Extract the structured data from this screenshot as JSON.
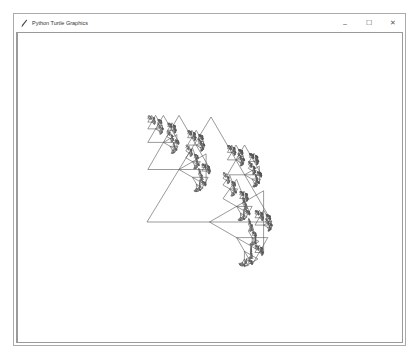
{
  "window": {
    "title": "Python Turtle Graphics",
    "controls": {
      "minimize": "–",
      "maximize": "☐",
      "close": "✕"
    },
    "icon": "feather-pen-icon"
  },
  "canvas": {
    "background": "#ffffff",
    "line_color": "#555555",
    "fractal": {
      "type": "sierpinski-branching-triangles",
      "root": {
        "apex": [
          211,
          117
        ],
        "left": [
          147,
          222
        ],
        "right": [
          272,
          222
        ]
      },
      "depth": 6
    }
  }
}
